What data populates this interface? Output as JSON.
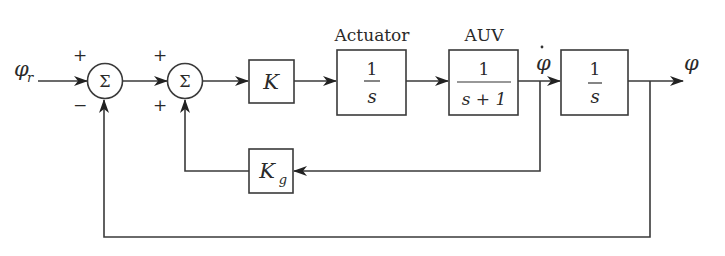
{
  "diagram": {
    "type": "block-diagram",
    "title": "",
    "input": {
      "label": "φ",
      "subscript": "r"
    },
    "output": {
      "label": "φ"
    },
    "summing_junctions": [
      {
        "id": "sum1",
        "symbol": "Σ",
        "signs": {
          "top": "+",
          "bottom": "−"
        }
      },
      {
        "id": "sum2",
        "symbol": "Σ",
        "signs": {
          "top": "+",
          "bottom": "+"
        }
      }
    ],
    "blocks": [
      {
        "id": "gain_k",
        "label": "K"
      },
      {
        "id": "actuator",
        "caption": "Actuator",
        "numerator": "1",
        "denominator": "s"
      },
      {
        "id": "auv",
        "caption": "AUV",
        "numerator": "1",
        "denominator": "s + 1"
      },
      {
        "id": "integrator",
        "numerator": "1",
        "denominator": "s"
      },
      {
        "id": "gain_kg",
        "label": "K",
        "subscript": "g"
      }
    ],
    "signals": {
      "rate": "φ̇",
      "rate_base": "φ"
    },
    "edges": [
      [
        "input",
        "sum1"
      ],
      [
        "sum1",
        "sum2"
      ],
      [
        "sum2",
        "gain_k"
      ],
      [
        "gain_k",
        "actuator"
      ],
      [
        "actuator",
        "auv"
      ],
      [
        "auv",
        "integrator"
      ],
      [
        "integrator",
        "output"
      ],
      [
        "auv_output_branch",
        "gain_kg"
      ],
      [
        "gain_kg",
        "sum2"
      ],
      [
        "output_branch",
        "sum1"
      ]
    ]
  }
}
